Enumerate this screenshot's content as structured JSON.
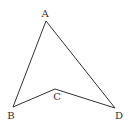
{
  "diagram": {
    "type": "quadrilateral (concave)",
    "stroke_color": "#333333",
    "points": [
      {
        "name": "A",
        "label": "A",
        "x": 46,
        "y": 21,
        "lx": 45,
        "ly": 17
      },
      {
        "name": "B",
        "label": "B",
        "x": 13,
        "y": 107,
        "lx": 11,
        "ly": 119
      },
      {
        "name": "C",
        "label": "C",
        "x": 55,
        "y": 89,
        "lx": 57,
        "ly": 100
      },
      {
        "name": "D",
        "label": "D",
        "x": 115,
        "y": 108,
        "lx": 119,
        "ly": 119
      }
    ],
    "edges": [
      [
        "A",
        "B"
      ],
      [
        "B",
        "C"
      ],
      [
        "C",
        "D"
      ],
      [
        "D",
        "A"
      ]
    ]
  }
}
